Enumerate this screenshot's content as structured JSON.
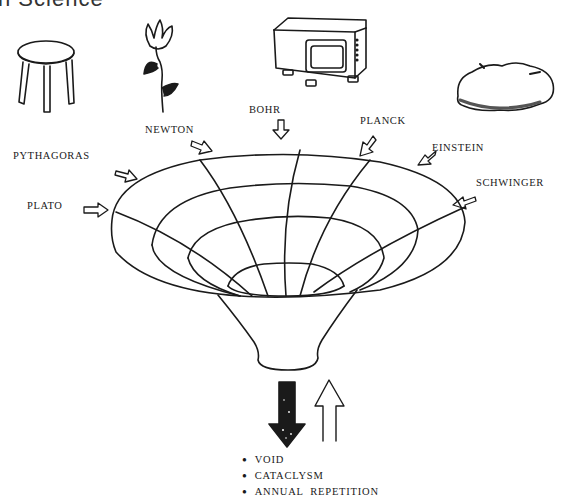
{
  "heading": "n Science",
  "objects": [
    {
      "name": "stool",
      "icon": "stool-icon"
    },
    {
      "name": "flower",
      "icon": "flower-icon"
    },
    {
      "name": "television",
      "icon": "television-icon"
    },
    {
      "name": "rock",
      "icon": "rock-icon"
    }
  ],
  "scientists": {
    "pythagoras": "PYTHAGORAS",
    "plato": "PLATO",
    "newton": "NEWTON",
    "bohr": "BOHR",
    "planck": "PLANCK",
    "einstein": "EINSTEIN",
    "schwinger": "SCHWINGER"
  },
  "funnel": {
    "description": "Funnel of converging scientific theories",
    "down_arrow": "solid-dark-down-arrow",
    "up_arrow": "outline-up-arrow"
  },
  "outcomes": [
    "VOID",
    "CATACLYSM",
    "ANNUAL  REPETITION"
  ],
  "colors": {
    "ink": "#1a1a1a",
    "paper": "#ffffff"
  }
}
